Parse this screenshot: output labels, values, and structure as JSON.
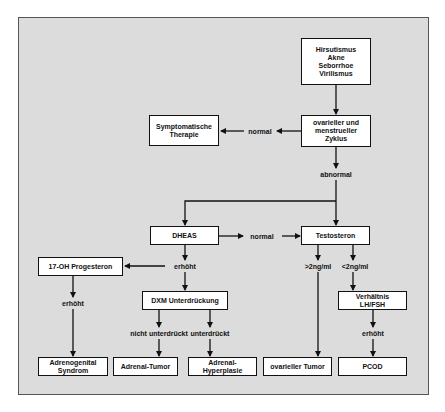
{
  "diagram": {
    "nodes": {
      "symptoms": "Hirsutismus\nAkne\nSeborrhoe\nVirilismus",
      "cycle": "ovarieller und\nmenstrueller\nZyklus",
      "symptomatic_therapy": "Symptomatische\nTherapie",
      "dheas": "DHEAS",
      "testosteron": "Testosteron",
      "ohp17": "17-OH Progesteron",
      "dxm": "DXM Unterdrückung",
      "lh_fsh": "Verhältnis\nLH/FSH",
      "adrenogenital": "Adrenogenital\nSyndrom",
      "adrenal_tumor": "Adrenal-Tumor",
      "adrenal_hyperplasia": "Adrenal-\nHyperplasie",
      "ovarian_tumor": "ovarieller Tumor",
      "pcod": "PCOD"
    },
    "labels": {
      "cycle_normal": "normal",
      "cycle_abnormal": "abnormal",
      "dheas_normal": "normal",
      "dheas_elevated": "erhöht",
      "ohp_elevated": "erhöht",
      "not_suppressed": "nicht unterdrückt",
      "suppressed": "unterdrückt",
      "testo_high": ">2ng/ml",
      "testo_low": "<2ng/ml",
      "lhfsh_elevated": "erhöht"
    },
    "colors": {
      "background": "#dcdcdc",
      "box": "#ffffff",
      "line": "#111111"
    }
  }
}
